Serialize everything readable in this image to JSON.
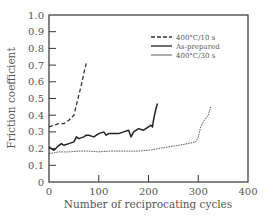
{
  "chart_data": {
    "type": "line",
    "title": "",
    "xlabel": "Number of reciprocating cycles",
    "ylabel": "Friction coefficient",
    "xlim": [
      0,
      400
    ],
    "ylim": [
      0,
      1.0
    ],
    "xticks": [
      0,
      100,
      200,
      300,
      400
    ],
    "yticks": [
      0,
      0.1,
      0.2,
      0.3,
      0.4,
      0.5,
      0.6,
      0.7,
      0.8,
      0.9,
      1.0
    ],
    "ytick_labels": [
      "0",
      "0.1",
      "0.2",
      "0.3",
      "0.4",
      "0.5",
      "0.6",
      "0.7",
      "0.8",
      "0.9",
      "1.0"
    ],
    "xtick_labels": [
      "0",
      "100",
      "200",
      "300",
      "400"
    ],
    "grid": false,
    "legend_position": "upper right",
    "series": [
      {
        "name": "400°C/10 s",
        "style": "dashed",
        "x": [
          0,
          10,
          20,
          30,
          40,
          50,
          55,
          60,
          65,
          70,
          75
        ],
        "y": [
          0.33,
          0.34,
          0.35,
          0.35,
          0.37,
          0.4,
          0.46,
          0.52,
          0.58,
          0.65,
          0.71
        ]
      },
      {
        "name": "As-prepared",
        "style": "solid-thick",
        "x": [
          0,
          5,
          10,
          20,
          25,
          30,
          40,
          50,
          55,
          60,
          70,
          75,
          80,
          90,
          100,
          110,
          115,
          120,
          130,
          140,
          150,
          160,
          165,
          170,
          180,
          190,
          200,
          205,
          208,
          210,
          212,
          215,
          218
        ],
        "y": [
          0.21,
          0.2,
          0.19,
          0.22,
          0.23,
          0.22,
          0.23,
          0.24,
          0.27,
          0.26,
          0.27,
          0.28,
          0.28,
          0.27,
          0.29,
          0.3,
          0.28,
          0.29,
          0.29,
          0.29,
          0.3,
          0.31,
          0.27,
          0.3,
          0.32,
          0.31,
          0.33,
          0.34,
          0.33,
          0.37,
          0.4,
          0.44,
          0.47
        ]
      },
      {
        "name": "400°C/30 s",
        "style": "dotted-thin",
        "x": [
          0,
          20,
          40,
          60,
          80,
          100,
          120,
          140,
          160,
          180,
          200,
          220,
          240,
          260,
          280,
          295,
          300,
          305,
          310,
          320,
          325
        ],
        "y": [
          0.17,
          0.18,
          0.18,
          0.185,
          0.185,
          0.18,
          0.185,
          0.185,
          0.185,
          0.185,
          0.19,
          0.2,
          0.21,
          0.22,
          0.23,
          0.24,
          0.27,
          0.33,
          0.36,
          0.4,
          0.45
        ]
      }
    ]
  },
  "legend": {
    "items": [
      {
        "label": "400°C/10 s"
      },
      {
        "label": "As-prepared"
      },
      {
        "label": "400°C/30 s"
      }
    ]
  },
  "axes": {
    "xlabel": "Number of reciprocating cycles",
    "ylabel": "Friction coefficient"
  }
}
